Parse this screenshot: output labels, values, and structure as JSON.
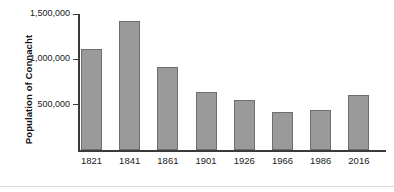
{
  "chart_data": {
    "type": "bar",
    "title": "",
    "xlabel": "",
    "ylabel": "Population of Connacht",
    "categories": [
      "1821",
      "1841",
      "1861",
      "1901",
      "1926",
      "1966",
      "1986",
      "2016"
    ],
    "values": [
      1110000,
      1420000,
      915000,
      645000,
      555000,
      415000,
      440000,
      610000
    ],
    "ylim": [
      0,
      1500000
    ],
    "yticks": [
      500000,
      1000000,
      1500000
    ],
    "ytick_labels": [
      "500,000",
      "1,000,000",
      "1,500,000"
    ],
    "grid": false,
    "legend": null,
    "bar_color": "#9a9a9a",
    "bar_edge_color": "#6e6e6e",
    "axis_color": "#3a3a3a"
  }
}
